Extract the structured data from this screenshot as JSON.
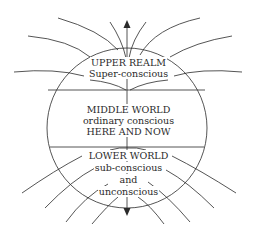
{
  "diagram": {
    "colors": {
      "line": "#2a2a2a",
      "background": "#ffffff"
    },
    "regions": [
      {
        "id": "upper",
        "title": "UPPER REALM",
        "lines": [
          "Super-conscious"
        ]
      },
      {
        "id": "middle",
        "title": "MIDDLE WORLD",
        "lines": [
          "ordinary conscious",
          "HERE AND NOW"
        ]
      },
      {
        "id": "lower",
        "title": "LOWER WORLD",
        "lines": [
          "sub-conscious",
          "and",
          "unconscious"
        ]
      }
    ],
    "arrows": [
      "up-arrow",
      "down-arrow"
    ]
  }
}
